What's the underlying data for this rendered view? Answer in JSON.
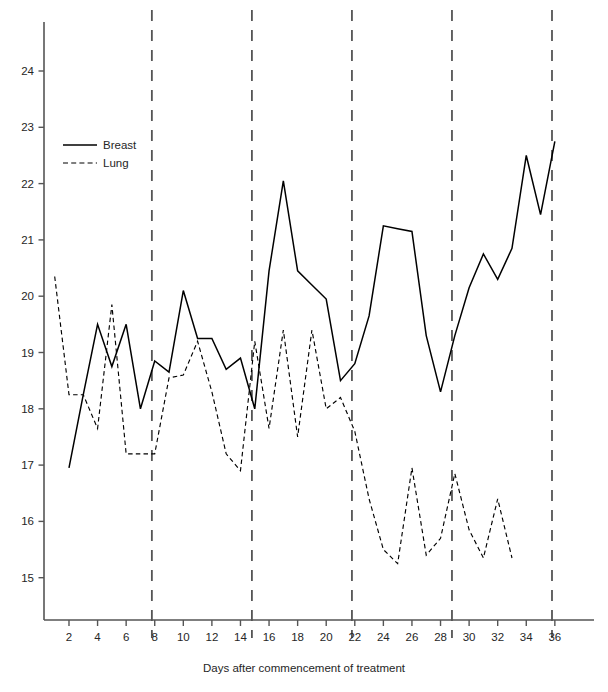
{
  "chart_data": {
    "type": "line",
    "title": "",
    "xlabel": "Days after commencement of treatment",
    "ylabel": "",
    "xlim": [
      0.6,
      37.4
    ],
    "ylim": [
      14.2,
      24.9
    ],
    "xticks": [
      2,
      4,
      6,
      8,
      10,
      12,
      14,
      16,
      18,
      20,
      22,
      24,
      26,
      28,
      30,
      32,
      34,
      36
    ],
    "xticks_minor": [
      1,
      3,
      5,
      7,
      9,
      11,
      13,
      15,
      17,
      19,
      21,
      23,
      25,
      27,
      29,
      31,
      33,
      35,
      37
    ],
    "yticks": [
      15,
      16,
      17,
      18,
      19,
      20,
      21,
      22,
      23,
      24
    ],
    "grid": false,
    "legend_position": "upper-left",
    "vertical_markers": {
      "values": [
        7.8,
        14.8,
        21.8,
        28.8,
        35.8
      ],
      "style": "dashed",
      "color": "#555555"
    },
    "series": [
      {
        "name": "Breast",
        "style": "solid",
        "color": "#000000",
        "x": [
          2,
          3,
          4,
          5,
          6,
          7,
          8,
          9,
          10,
          11,
          12,
          13,
          14,
          15,
          16,
          17,
          18,
          19,
          20,
          21,
          22,
          23,
          24,
          25,
          26,
          27,
          28,
          29,
          30,
          31,
          32,
          33,
          34,
          35,
          36
        ],
        "values": [
          16.95,
          18.25,
          19.5,
          18.75,
          19.5,
          18.0,
          18.85,
          18.65,
          20.1,
          19.25,
          19.25,
          18.7,
          18.9,
          18.0,
          20.45,
          22.05,
          20.45,
          20.2,
          19.95,
          18.5,
          18.8,
          19.65,
          21.25,
          21.2,
          21.15,
          19.3,
          18.3,
          19.3,
          20.15,
          20.75,
          20.3,
          20.85,
          22.5,
          21.45,
          22.75
        ]
      },
      {
        "name": "Lung",
        "style": "dashed",
        "color": "#000000",
        "x": [
          1,
          2,
          3,
          4,
          5,
          6,
          7,
          8,
          9,
          10,
          11,
          12,
          13,
          14,
          15,
          16,
          17,
          18,
          19,
          20,
          21,
          22,
          23,
          24,
          25,
          26,
          27,
          28,
          29,
          30,
          31,
          32,
          33
        ],
        "values": [
          20.35,
          18.25,
          18.25,
          17.65,
          19.85,
          17.2,
          17.2,
          17.2,
          18.55,
          18.6,
          19.2,
          18.3,
          17.2,
          16.9,
          19.2,
          17.65,
          19.4,
          17.5,
          19.4,
          18.0,
          18.2,
          17.6,
          16.4,
          15.5,
          15.25,
          16.95,
          15.4,
          15.7,
          16.85,
          15.85,
          15.35,
          16.4,
          15.35
        ]
      }
    ]
  },
  "legend": {
    "items": [
      {
        "label": "Breast",
        "style": "solid"
      },
      {
        "label": "Lung",
        "style": "dashed"
      }
    ]
  },
  "axis": {
    "x_title": "Days after commencement of treatment"
  }
}
